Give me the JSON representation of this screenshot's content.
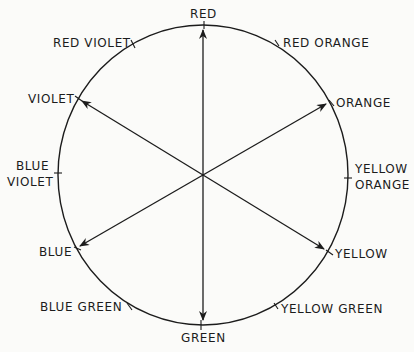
{
  "diagram": {
    "type": "color-wheel",
    "colors": {
      "ink": "#1c1c1c",
      "background": "#fbfbf9"
    },
    "labels": {
      "red": "RED",
      "red_orange": "RED ORANGE",
      "orange": "ORANGE",
      "yellow_orange_1": "YELLOW",
      "yellow_orange_2": "ORANGE",
      "yellow": "YELLOW",
      "yellow_green": "YELLOW GREEN",
      "green": "GREEN",
      "blue_green": "BLUE GREEN",
      "blue": "BLUE",
      "blue_violet_1": "BLUE",
      "blue_violet_2": "VIOLET",
      "violet": "VIOLET",
      "red_violet": "RED VIOLET"
    },
    "complementary_pairs": [
      [
        "RED",
        "GREEN"
      ],
      [
        "ORANGE",
        "BLUE"
      ],
      [
        "YELLOW",
        "VIOLET"
      ]
    ]
  }
}
